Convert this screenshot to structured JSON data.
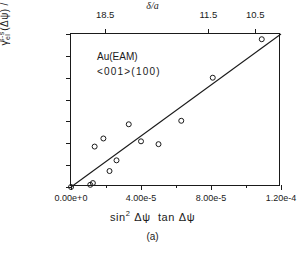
{
  "chart_data": {
    "type": "scatter",
    "title": "",
    "xlabel": "sin2 Δψ  tan Δψ",
    "ylabel": "γel(s-s) (Δψ) / cos (Δψ)",
    "xlim": [
      0.0,
      0.00012
    ],
    "ylim": [
      0.0,
      0.07
    ],
    "grid": false,
    "legend": "none",
    "x_ticks": [
      {
        "value": 0.0,
        "label": "0.00e+0"
      },
      {
        "value": 4e-05,
        "label": "4.00e-5"
      },
      {
        "value": 8e-05,
        "label": "8.00e-5"
      },
      {
        "value": 0.00012,
        "label": "1.20e-4"
      }
    ],
    "x_minor_ticks": [
      2e-05,
      6e-05,
      0.0001
    ],
    "y_ticks": [
      {
        "value": 0.0,
        "label": "0.00"
      },
      {
        "value": 0.01,
        "label": "0.01"
      },
      {
        "value": 0.02,
        "label": "0.02"
      },
      {
        "value": 0.03,
        "label": "0.03"
      },
      {
        "value": 0.04,
        "label": "0.04"
      },
      {
        "value": 0.05,
        "label": "0.05"
      },
      {
        "value": 0.06,
        "label": "0.06"
      },
      {
        "value": 0.07,
        "label": "0.07"
      }
    ],
    "top_axis": {
      "title_delta": "δ",
      "title_rest": "/a",
      "ticks": [
        {
          "value": 1.95e-05,
          "label": "18.5"
        },
        {
          "value": 7.85e-05,
          "label": "11.5"
        },
        {
          "value": 0.0001053,
          "label": "10.5"
        }
      ]
    },
    "annotations": [
      {
        "text": "Au(EAM)"
      },
      {
        "text": "<001>(100)"
      }
    ],
    "caption": "(a)",
    "marker": "open-circle",
    "series": [
      {
        "name": "Au(EAM) <001>(100)",
        "points": [
          [
            0.0,
            0.0
          ],
          [
            1.1e-05,
            0.001
          ],
          [
            1.25e-05,
            0.0018
          ],
          [
            1.35e-05,
            0.0185
          ],
          [
            1.85e-05,
            0.0222
          ],
          [
            2.2e-05,
            0.0073
          ],
          [
            2.6e-05,
            0.0122
          ],
          [
            3.3e-05,
            0.0287
          ],
          [
            4e-05,
            0.0209
          ],
          [
            5e-05,
            0.0196
          ],
          [
            6.3e-05,
            0.0303
          ],
          [
            8.1e-05,
            0.05
          ],
          [
            0.000109,
            0.0676
          ]
        ]
      }
    ],
    "fit_line": {
      "from": [
        0.0,
        0.0
      ],
      "to": [
        0.00012,
        0.07
      ],
      "style": "solid"
    },
    "colors": {
      "axis": "#1a1a1a",
      "marker": "#1a1a1a",
      "line": "#1a1a1a",
      "background": "#ffffff"
    }
  }
}
